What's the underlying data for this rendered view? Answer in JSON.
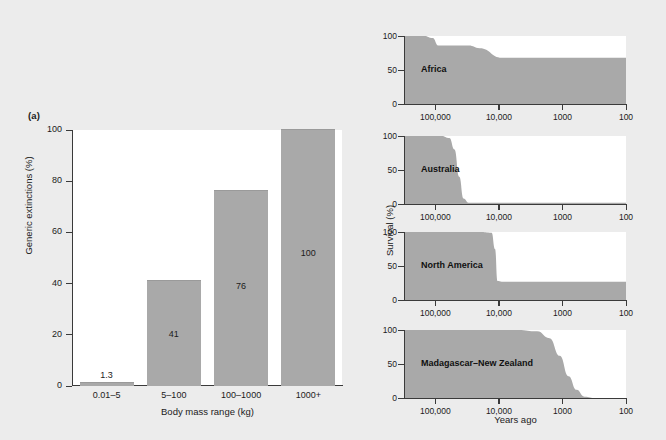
{
  "figure": {
    "background_color": "#ececec",
    "fill_color": "#a9a9a9",
    "axis_color": "#3a3a3a"
  },
  "panel_a": {
    "tag": "(a)",
    "ylabel": "Generic extinctions (%)",
    "xlabel": "Body mass range (kg)",
    "yticks": [
      "0",
      "20",
      "40",
      "60",
      "80",
      "100"
    ]
  },
  "panel_b": {
    "tag": "(b)",
    "ylabel": "Survival (%)",
    "xlabel": "Years ago",
    "yticks": [
      "0",
      "50",
      "100"
    ],
    "xticks": [
      "100,000",
      "10,000",
      "1000",
      "100"
    ],
    "regions": [
      "Africa",
      "Australia",
      "North America",
      "Madagascar–New Zealand"
    ]
  },
  "chart_data": [
    {
      "type": "bar",
      "title": "(a) Generic extinctions by body mass",
      "categories": [
        "0.01–5",
        "5–100",
        "100–1000",
        "1000+"
      ],
      "values": [
        1.3,
        41,
        76,
        100
      ],
      "value_labels": [
        "1.3",
        "41",
        "76",
        "100"
      ],
      "xlabel": "Body mass range (kg)",
      "ylabel": "Generic extinctions (%)",
      "ylim": [
        0,
        100
      ],
      "yticks": [
        0,
        20,
        40,
        60,
        80,
        100
      ],
      "grid": false,
      "legend": "none",
      "bar_color": "#a9a9a9"
    },
    {
      "type": "area",
      "title": "Africa",
      "xlabel": "Years ago",
      "ylabel": "Survival (%)",
      "xscale": "log-reversed",
      "xlim": [
        300000,
        100
      ],
      "ylim": [
        0,
        100
      ],
      "yticks": [
        0,
        50,
        100
      ],
      "xticks": [
        100000,
        10000,
        1000,
        100
      ],
      "x": [
        300000,
        150000,
        110000,
        90000,
        30000,
        20000,
        9000,
        1000,
        100
      ],
      "y": [
        100,
        100,
        97,
        86,
        86,
        82,
        68,
        68,
        68
      ]
    },
    {
      "type": "area",
      "title": "Australia",
      "xlabel": "Years ago",
      "ylabel": "Survival (%)",
      "xscale": "log-reversed",
      "xlim": [
        300000,
        100
      ],
      "ylim": [
        0,
        100
      ],
      "yticks": [
        0,
        50,
        100
      ],
      "xticks": [
        100000,
        10000,
        1000,
        100
      ],
      "x": [
        300000,
        80000,
        60000,
        50000,
        42000,
        36000,
        30000,
        10000,
        1000,
        100
      ],
      "y": [
        100,
        100,
        97,
        80,
        40,
        8,
        2,
        2,
        2,
        2
      ]
    },
    {
      "type": "area",
      "title": "North America",
      "xlabel": "Years ago",
      "ylabel": "Survival (%)",
      "xscale": "log-reversed",
      "xlim": [
        300000,
        100
      ],
      "ylim": [
        0,
        100
      ],
      "yticks": [
        0,
        50,
        100
      ],
      "xticks": [
        100000,
        10000,
        1000,
        100
      ],
      "x": [
        300000,
        20000,
        13000,
        11500,
        10500,
        9000,
        1000,
        100
      ],
      "y": [
        100,
        100,
        99,
        75,
        28,
        27,
        27,
        27
      ]
    },
    {
      "type": "area",
      "title": "Madagascar–New Zealand",
      "xlabel": "Years ago",
      "ylabel": "Survival (%)",
      "xscale": "log-reversed",
      "xlim": [
        300000,
        100
      ],
      "ylim": [
        0,
        100
      ],
      "yticks": [
        0,
        50,
        100
      ],
      "xticks": [
        100000,
        10000,
        1000,
        100
      ],
      "x": [
        300000,
        5000,
        2500,
        1600,
        1100,
        800,
        600,
        450,
        300,
        100
      ],
      "y": [
        100,
        100,
        98,
        88,
        62,
        32,
        12,
        2,
        0,
        0
      ]
    }
  ]
}
